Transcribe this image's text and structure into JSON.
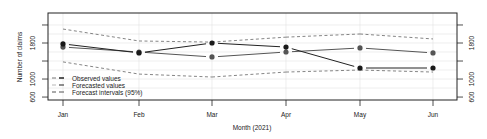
{
  "chart_data": {
    "type": "line",
    "title": "",
    "xlabel": "Month (2021)",
    "ylabel": "Number of claims",
    "categories": [
      "Jan",
      "Feb",
      "Mar",
      "Apr",
      "May",
      "Jun"
    ],
    "ylim": [
      600,
      2300
    ],
    "yticks": [
      600,
      1000,
      1400,
      1800,
      2200
    ],
    "ytick_labels_shown": [
      "600",
      "1000",
      "1800"
    ],
    "grid": true,
    "legend_position": "bottom-left inside",
    "series": [
      {
        "name": "Observed values",
        "style": "solid",
        "color": "#222222",
        "marker": "filled-circle",
        "values": [
          1780,
          1580,
          1800,
          1710,
          1245,
          1245
        ]
      },
      {
        "name": "Forecasted values",
        "style": "solid",
        "color": "#555555",
        "marker": "filled-circle",
        "values": [
          1710,
          1600,
          1490,
          1600,
          1690,
          1580
        ]
      },
      {
        "name": "Forecast intervals (95%) upper",
        "style": "dashed",
        "color": "#555555",
        "values": [
          2110,
          1845,
          1820,
          1930,
          2000,
          1890
        ]
      },
      {
        "name": "Forecast intervals (95%) lower",
        "style": "dashed",
        "color": "#555555",
        "values": [
          1380,
          1110,
          1045,
          1155,
          1200,
          1155
        ]
      }
    ],
    "legend": [
      "Observed values",
      "Forecasted values",
      "Forecast intervals (95%)"
    ]
  },
  "axes": {
    "xlabel": "Month (2021)",
    "ylabel": "Number of claims",
    "x_ticks": [
      "Jan",
      "Feb",
      "Mar",
      "Apr",
      "May",
      "Jun"
    ],
    "y_ticks_left": [
      "600",
      "1000",
      "1800"
    ],
    "y_ticks_right": [
      "600",
      "1000",
      "1800"
    ]
  },
  "legend": {
    "observed": "Observed values",
    "forecasted": "Forecasted values",
    "intervals": "Forecast intervals (95%)"
  }
}
